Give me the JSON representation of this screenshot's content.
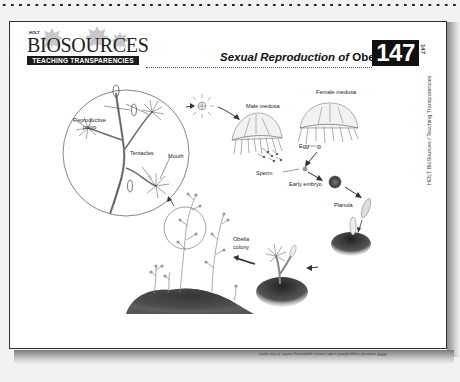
{
  "header": {
    "logo_publisher": "HOLT",
    "logo_wordmark": "BIOSOURCES",
    "logo_subtitle": "TEACHING TRANSPARENCIES",
    "title_italic": "Sexual Reproduction of",
    "title_plain": "Obelia",
    "transparency_number": "147"
  },
  "side_margin": {
    "number": "147",
    "text": "HOLT BioSources / Teaching Transparencies"
  },
  "diagram": {
    "labels": {
      "reproductive_polyp": "Reproductive",
      "reproductive_polyp_2": "polyp",
      "tentacles": "Tentacles",
      "mouth": "Mouth",
      "male_medusa": "Male medusa",
      "female_medusa": "Female medusa",
      "egg": "Egg",
      "sperm": "Sperm",
      "early_embryo": "Early embryo",
      "planula": "Planula",
      "colony_italic": "Obelia",
      "colony": "colony"
    },
    "colors": {
      "line": "#444444",
      "substrate": "#3a3a3a",
      "embryo": "#555555"
    }
  },
  "footer": {
    "copyright_note": "HRW material copyrighted under notice appearing earlier in this work."
  }
}
